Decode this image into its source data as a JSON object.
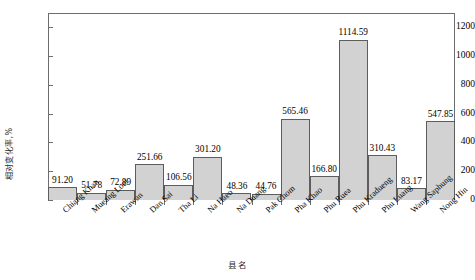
{
  "chart_data": {
    "type": "bar",
    "title": "",
    "xlabel": "县名",
    "ylabel": "相对变化率,%",
    "ylim": [
      0,
      1300
    ],
    "yticks": [
      0,
      200,
      400,
      600,
      800,
      1000,
      1200
    ],
    "ytick_labels": [
      "0",
      "200",
      "400",
      "600",
      "800",
      "1000",
      "1200"
    ],
    "grid": false,
    "legend": "none",
    "bar_fill_color": "#d2d2d2",
    "bar_edge_color": "#5d5d5d",
    "categories": [
      "Chiang Khan",
      "Mueang Loei",
      "Erawan",
      "Dan Sai",
      "Tha Li",
      "Na Haeo",
      "Na Duang",
      "Pak Chom",
      "Pha Khao",
      "Phu Ruea",
      "Phu Kradueng",
      "Phu Luang",
      "Wang Saphung",
      "Nong Hin"
    ],
    "values": [
      91.2,
      51.78,
      72.89,
      251.66,
      106.56,
      301.2,
      48.36,
      44.76,
      565.46,
      166.8,
      1114.59,
      310.43,
      83.17,
      547.85
    ],
    "value_labels": [
      "91.20",
      "51.78",
      "72.89",
      "251.66",
      "106.56",
      "301.20",
      "48.36",
      "44.76",
      "565.46",
      "166.80",
      "1114.59",
      "310.43",
      "83.17",
      "547.85"
    ]
  }
}
